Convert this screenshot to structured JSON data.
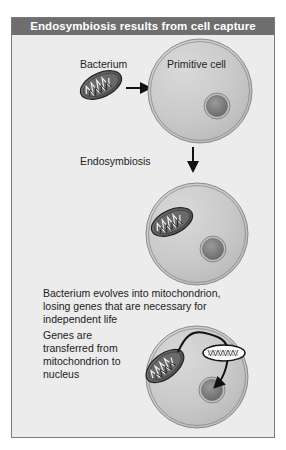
{
  "figure": {
    "title": "Endosymbiosis results from cell capture",
    "labels": {
      "bacterium": "Bacterium",
      "primitive_cell": "Primitive cell",
      "endosymbiosis": "Endosymbiosis"
    },
    "captions": {
      "evolution": "Bacterium evolves into mitochondrion, losing genes that are necessary for independent life",
      "gene_transfer": "Genes are transferred from mitochondrion to nucleus"
    },
    "stages": [
      {
        "name": "capture",
        "elements": [
          "bacterium",
          "arrow-right",
          "primitive-cell",
          "nucleus"
        ]
      },
      {
        "name": "endosymbiosis",
        "elements": [
          "arrow-down",
          "cell",
          "mitochondrion",
          "nucleus"
        ]
      },
      {
        "name": "gene-transfer",
        "elements": [
          "cell",
          "mitochondrion",
          "dna-segment",
          "nucleus",
          "transfer-arrow"
        ]
      }
    ],
    "colors": {
      "header_bg": "#6e6e6e",
      "panel_bg": "#ececec",
      "cell_fill": "#d4d4d4",
      "nucleus_fill": "#8a8a8a",
      "mitochondrion_fill": "#5a5a5a"
    }
  }
}
